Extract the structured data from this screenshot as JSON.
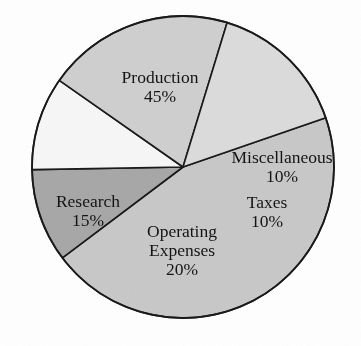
{
  "chart_data": {
    "type": "pie",
    "title": "",
    "subtitle": "",
    "xlabel": "",
    "ylabel": "",
    "legend_position": "none",
    "grid": false,
    "units": "percent",
    "total": 100,
    "categories": [
      "Production",
      "Miscellaneous",
      "Taxes",
      "Operating Expenses",
      "Research"
    ],
    "values": [
      45,
      10,
      10,
      20,
      15
    ],
    "slices": [
      {
        "name": "production",
        "label": "Production",
        "value_label": "45%",
        "value": 45,
        "color": "#c9c9c9",
        "label_lines": [
          "Production",
          "45%"
        ],
        "label_x": 160,
        "label_y": 88
      },
      {
        "name": "miscellaneous",
        "label": "Miscellaneous",
        "value_label": "10%",
        "value": 10,
        "color": "#a8a8a8",
        "label_lines": [
          "Miscellaneous",
          "10%"
        ],
        "label_x": 282,
        "label_y": 168
      },
      {
        "name": "taxes",
        "label": "Taxes",
        "value_label": "10%",
        "value": 10,
        "color": "#f7f7f7",
        "label_lines": [
          "Taxes",
          "10%"
        ],
        "label_x": 267,
        "label_y": 213
      },
      {
        "name": "operating-expenses",
        "label": "Operating Expenses",
        "value_label": "20%",
        "value": 20,
        "color": "#d0d0d0",
        "label_lines": [
          "Operating",
          "Expenses",
          "20%"
        ],
        "label_x": 182,
        "label_y": 252
      },
      {
        "name": "research",
        "label": "Research",
        "value_label": "15%",
        "value": 15,
        "color": "#dcdcdc",
        "label_lines": [
          "Research",
          "15%"
        ],
        "label_x": 88,
        "label_y": 212
      }
    ],
    "geometry": {
      "center_x": 183,
      "center_y": 167,
      "radius": 151,
      "start_angle_deg": -19
    },
    "stroke_color": "#1a1a1a",
    "background_color": "#ffffff"
  }
}
